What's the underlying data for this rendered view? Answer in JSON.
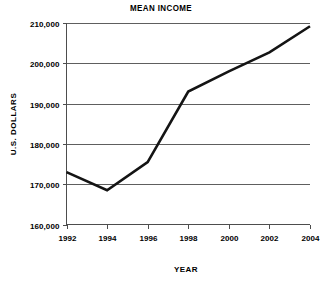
{
  "chart_data": {
    "type": "line",
    "title": "MEAN INCOME",
    "xlabel": "YEAR",
    "ylabel": "U.S. DOLLARS",
    "x": [
      1992,
      1994,
      1996,
      1998,
      2000,
      2002,
      2004
    ],
    "categories": [
      "1992",
      "1994",
      "1996",
      "1998",
      "2000",
      "2002",
      "2004"
    ],
    "values": [
      173000,
      168500,
      175500,
      193000,
      198000,
      202700,
      209200
    ],
    "series": [
      {
        "name": "Mean Income",
        "values": [
          173000,
          168500,
          175500,
          193000,
          198000,
          202700,
          209200
        ],
        "color": "#141414"
      }
    ],
    "xlim": [
      1992,
      2004
    ],
    "ylim": [
      160000,
      210000
    ],
    "ytick_values": [
      160000,
      170000,
      180000,
      190000,
      200000,
      210000
    ],
    "ytick_labels": [
      "160,000",
      "170,000",
      "180,000",
      "190,000",
      "200,000",
      "210,000"
    ],
    "xtick_labels": [
      "1992",
      "1994",
      "1996",
      "1998",
      "2000",
      "2002",
      "2004"
    ],
    "grid": "horizontal",
    "legend": "none",
    "line_color": "#141414",
    "axis_color": "#4d4d4d",
    "background_color": "#ffffff"
  }
}
